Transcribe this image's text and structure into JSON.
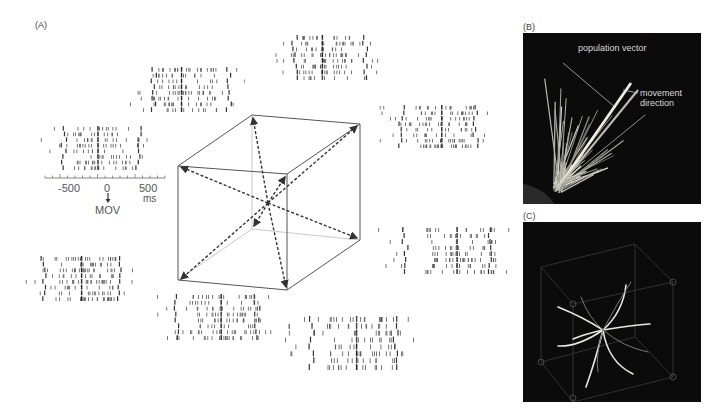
{
  "panels": {
    "A": {
      "label": "(A)",
      "axis": {
        "ticks": [
          "-500",
          "0",
          "500"
        ],
        "unit": "ms",
        "event_label": "MOV"
      },
      "rasters": [
        {
          "name": "raster-left",
          "x": 40,
          "y": 125,
          "w": 115,
          "h": 45,
          "trials": 8
        },
        {
          "name": "raster-upper-left",
          "x": 130,
          "y": 66,
          "w": 115,
          "h": 46,
          "trials": 8
        },
        {
          "name": "raster-top",
          "x": 273,
          "y": 34,
          "w": 107,
          "h": 46,
          "trials": 8
        },
        {
          "name": "raster-right-top",
          "x": 378,
          "y": 104,
          "w": 114,
          "h": 44,
          "trials": 8
        },
        {
          "name": "raster-right-bottom",
          "x": 378,
          "y": 226,
          "w": 132,
          "h": 48,
          "trials": 8
        },
        {
          "name": "raster-bottom-right",
          "x": 285,
          "y": 315,
          "w": 130,
          "h": 55,
          "trials": 8
        },
        {
          "name": "raster-bottom-center",
          "x": 150,
          "y": 293,
          "w": 125,
          "h": 47,
          "trials": 8
        },
        {
          "name": "raster-left-bottom",
          "x": 20,
          "y": 255,
          "w": 115,
          "h": 46,
          "trials": 8
        }
      ]
    },
    "B": {
      "label": "(B)",
      "annotations": [
        "population vector",
        "movement direction"
      ],
      "background": "#0b0b0b"
    },
    "C": {
      "label": "(C)",
      "background": "#0b0b0b"
    }
  }
}
